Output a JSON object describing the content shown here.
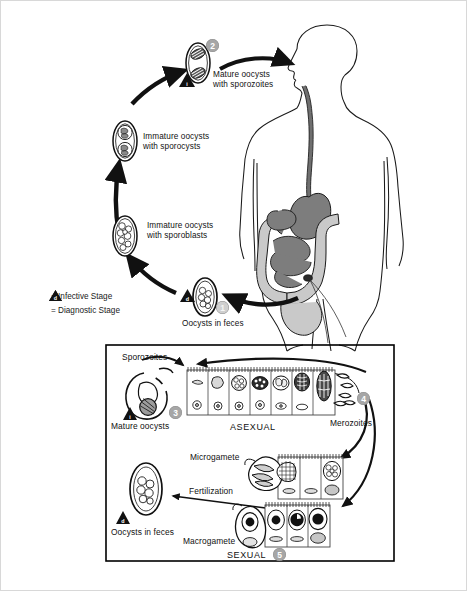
{
  "diagram": {
    "colors": {
      "badge_gray": "#a6a6a6",
      "badge_pale": "#cfcfcf",
      "organ_dark": "#7d7d7d",
      "organ_mid": "#9a9a9a",
      "organ_light": "#c9c9c9",
      "outline": "#000000",
      "page_border": "#d8d8d8"
    },
    "legend": [
      {
        "symbol": "i",
        "icon": "warning-triangle-icon",
        "text": "= Infective Stage"
      },
      {
        "symbol": "d",
        "icon": "warning-triangle-icon",
        "text": "= Diagnostic Stage"
      }
    ],
    "outer_cycle": {
      "stages": [
        {
          "id": "mature-oocysts-sporozoites",
          "label": "Mature oocysts\nwith sporozoites",
          "badge": "2",
          "marker": "i"
        },
        {
          "id": "immature-oocysts-sporocysts",
          "label": "Immature oocysts\nwith sporocysts",
          "badge": "",
          "marker": ""
        },
        {
          "id": "immature-oocysts-sporoblasts",
          "label": "Immature oocysts\nwith sporoblasts",
          "badge": "",
          "marker": ""
        },
        {
          "id": "oocysts-in-feces",
          "label": "Oocysts in feces",
          "badge": "1",
          "marker": "d"
        }
      ]
    },
    "inset": {
      "asexual": {
        "section_label": "ASEXUAL",
        "badge": "4",
        "sporozoites_label": "Sporozoites",
        "mature_oocysts_label": "Mature oocysts",
        "mature_oocysts_badge": "3",
        "mature_oocysts_marker": "i",
        "merozoites_label": "Merozoites",
        "cell_count": 7
      },
      "sexual": {
        "section_label": "SEXUAL",
        "badge": "5",
        "microgamete_label": "Microgamete",
        "macrogamete_label": "Macrogamete",
        "fertilization_label": "Fertilization",
        "oocysts_label": "Oocysts in feces",
        "oocysts_marker": "d",
        "microgamete_cells": 3,
        "macrogamete_cells": 3
      }
    }
  }
}
